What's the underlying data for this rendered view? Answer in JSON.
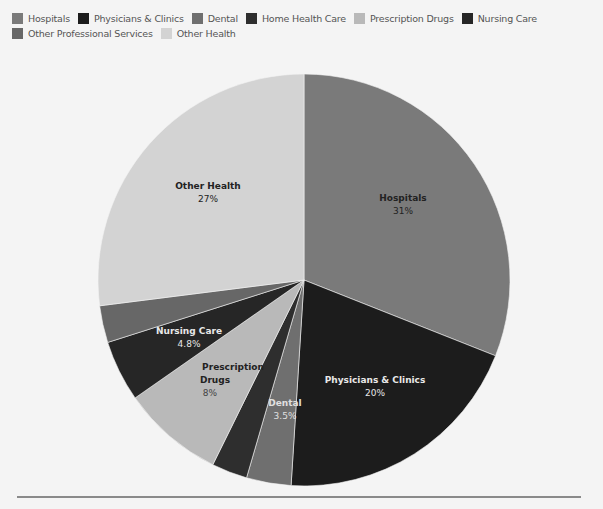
{
  "chart_data": {
    "type": "pie",
    "title": "",
    "legend_position": "top",
    "start_angle_deg": 0,
    "direction": "clockwise",
    "center": [
      304,
      280
    ],
    "radius": 206,
    "slices": [
      {
        "name": "Hospitals",
        "value": 31,
        "label": "31%",
        "color": "#7a7a7a",
        "text_color": "#222222",
        "labeled": true
      },
      {
        "name": "Physicians & Clinics",
        "value": 20,
        "label": "20%",
        "color": "#1c1c1c",
        "text_color": "#e8e8e8",
        "labeled": true
      },
      {
        "name": "Dental",
        "value": 3.5,
        "label": "3.5%",
        "color": "#6f6f6f",
        "text_color": "#e0e0e0",
        "labeled": true
      },
      {
        "name": "Home Health Care",
        "value": 2.8,
        "label": "",
        "color": "#2e2e2e",
        "text_color": "#e0e0e0",
        "labeled": false
      },
      {
        "name": "Prescription Drugs",
        "value": 8,
        "label": "8%",
        "color": "#b9b9b9",
        "text_color": "#333333",
        "labeled": true
      },
      {
        "name": "Nursing Care",
        "value": 4.8,
        "label": "4.8%",
        "color": "#262626",
        "text_color": "#e8e8e8",
        "labeled": true
      },
      {
        "name": "Other Professional Services",
        "value": 2.9,
        "label": "",
        "color": "#676767",
        "text_color": "#e0e0e0",
        "labeled": false
      },
      {
        "name": "Other Health",
        "value": 27,
        "label": "27%",
        "color": "#d3d3d3",
        "text_color": "#222222",
        "labeled": true
      }
    ],
    "categories": [
      "Hospitals",
      "Physicians & Clinics",
      "Dental",
      "Home Health Care",
      "Prescription Drugs",
      "Nursing Care",
      "Other Professional Services",
      "Other Health"
    ],
    "values": [
      31,
      20,
      3.5,
      2.8,
      8,
      4.8,
      2.9,
      27
    ],
    "unit": "%"
  },
  "legend": {
    "items": [
      {
        "label": "Hospitals",
        "color": "#7a7a7a"
      },
      {
        "label": "Physicians & Clinics",
        "color": "#1c1c1c"
      },
      {
        "label": "Dental",
        "color": "#6f6f6f"
      },
      {
        "label": "Home Health Care",
        "color": "#2e2e2e"
      },
      {
        "label": "Prescription Drugs",
        "color": "#b9b9b9"
      },
      {
        "label": "Nursing Care",
        "color": "#262626"
      },
      {
        "label": "Other Professional Services",
        "color": "#676767"
      },
      {
        "label": "Other Health",
        "color": "#d3d3d3"
      }
    ]
  },
  "labels": {
    "hospitals": {
      "name": "Hospitals",
      "value": "31%"
    },
    "physicians": {
      "name": "Physicians & Clinics",
      "value": "20%"
    },
    "dental": {
      "name": "Dental",
      "value": "3.5%"
    },
    "prescription_line1": "Prescription",
    "prescription_line2": "Drugs",
    "prescription_value": "8%",
    "nursing": {
      "name": "Nursing Care",
      "value": "4.8%"
    },
    "other_health": {
      "name": "Other Health",
      "value": "27%"
    }
  }
}
